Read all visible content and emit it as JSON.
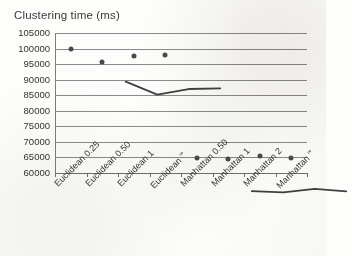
{
  "chart_data": {
    "type": "line",
    "title": "Clustering time (ms)",
    "xlabel": "",
    "ylabel": "",
    "ylim": [
      60000,
      105000
    ],
    "ytick_step": 5000,
    "yticks": [
      105000,
      100000,
      95000,
      90000,
      85000,
      80000,
      75000,
      70000,
      65000,
      60000
    ],
    "ytick_labels": [
      "105000",
      "100000",
      "95000",
      "90000",
      "85000",
      "80000",
      "75000",
      "70000",
      "65000",
      "60000"
    ],
    "grid": true,
    "legend": "none",
    "categories": [
      "Euclidean 0.25",
      "Euclidean 0.50",
      "Euclidean 1",
      "Euclidean ∞",
      "Manhattan 0.50",
      "Manhattan 1",
      "Manhattan 2",
      "Manhattan ∞"
    ],
    "category_parts": [
      {
        "base": "Euclidean 0.25",
        "sup": ""
      },
      {
        "base": "Euclidean 0.50",
        "sup": ""
      },
      {
        "base": "Euclidean 1",
        "sup": ""
      },
      {
        "base": "Euclidean ",
        "sup": "∞"
      },
      {
        "base": "Manhattan 0.50",
        "sup": ""
      },
      {
        "base": "Manhattan 1",
        "sup": ""
      },
      {
        "base": "Manhattan 2",
        "sup": ""
      },
      {
        "base": "Manhattan ",
        "sup": "∞"
      }
    ],
    "series": [
      {
        "name": "Clustering time (ms)",
        "color": "#404040",
        "values": [
          100000,
          95800,
          97600,
          97800,
          64800,
          64400,
          65500,
          64700
        ],
        "segments": [
          {
            "name": "Euclidean",
            "category_indices": [
              0,
              1,
              2,
              3
            ],
            "values": [
              100000,
              95800,
              97600,
              97800
            ]
          },
          {
            "name": "Manhattan",
            "category_indices": [
              4,
              5,
              6,
              7
            ],
            "values": [
              64800,
              64400,
              65500,
              64700
            ]
          }
        ]
      }
    ],
    "marker": "circle",
    "marker_color": "#4a4a4a",
    "line_color": "#404040",
    "gridline_color": "#8a8a8a",
    "background_color": "#fdfdfb"
  }
}
